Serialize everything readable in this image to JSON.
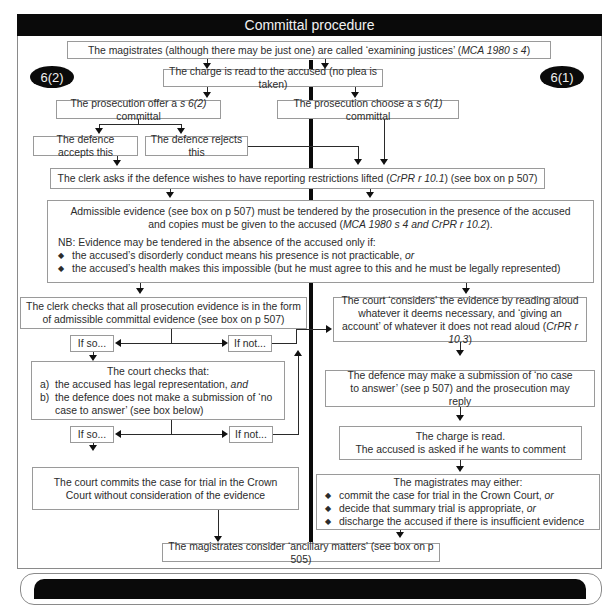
{
  "title": "Committal procedure",
  "badges": {
    "left": "6(2)",
    "right": "6(1)"
  },
  "nodes": {
    "examining_justices": {
      "text": "The magistrates (although there may be just one) are called ‘examining justices’ (",
      "ref": "MCA 1980 s 4",
      "tail": ")"
    },
    "charge_read": "The charge is read to the accused (no plea is taken)",
    "prosecution_offer": {
      "pre": "The prosecution offer a ",
      "ref": "s 6(2)",
      "post": " committal"
    },
    "prosecution_choose": {
      "pre": "The prosecution choose a ",
      "ref": "s 6(1)",
      "post": " committal"
    },
    "defence_accepts": "The defence accepts this",
    "defence_rejects": "The defence rejects this",
    "clerk_asks": {
      "pre": "The clerk asks if the defence wishes to have reporting restrictions lifted (",
      "ref": "CrPR r 10.1",
      "post": ") (see box on p 507)"
    },
    "admissible_evidence": {
      "line1": "Admissible evidence (see box on p 507) must be tendered by the prosecution in the presence of the accused",
      "line2_pre": "and copies must be given to the accused (",
      "line2_ref": "MCA 1980 s 4 and CrPR r 10.2",
      "line2_post": ").",
      "nb": "NB: Evidence may be tendered in the absence of the accused only if:",
      "bullets": [
        {
          "text": "the accused’s disorderly conduct means his presence is not practicable, ",
          "em": "or"
        },
        {
          "text": "the accused’s health makes this impossible (but he must agree to this and he must be legally represented)",
          "em": ""
        }
      ],
      "bullet_glyph": "◆"
    },
    "clerk_checks": "The clerk checks that all prosecution evidence is in the form of admissible committal evidence (see box on p 507)",
    "if_so_1": "If so...",
    "if_not_1": "If not...",
    "court_checks": {
      "heading": "The court checks that:",
      "items": [
        {
          "key": "a)",
          "text": "the accused has legal representation, ",
          "em": "and"
        },
        {
          "key": "b)",
          "text": "the defence does not make a submission of ‘no case to answer’ (see box below)",
          "em": ""
        }
      ]
    },
    "if_so_2": "If so...",
    "if_not_2": "If not...",
    "court_commits": "The court commits the case for trial in the Crown Court without consideration of the evidence",
    "court_considers": {
      "pre": "The court ‘considers’ the evidence by reading aloud whatever it deems necessary, and ‘giving an account’ of whatever it does not read aloud (",
      "ref": "CrPR r 10.3",
      "post": ")"
    },
    "no_case_submission": "The defence may make a submission of ‘no case to answer’ (see p 507) and the prosecution may reply",
    "charge_read_again": {
      "line1": "The charge is read.",
      "line2": "The accused is asked if he wants to comment"
    },
    "magistrates_either": {
      "heading": "The magistrates may either:",
      "bullets": [
        {
          "text": "commit the case for trial in the Crown Court, ",
          "em": "or"
        },
        {
          "text": "decide that summary trial is appropriate, ",
          "em": "or"
        },
        {
          "text": "discharge the accused if there is insufficient evidence",
          "em": ""
        }
      ]
    },
    "ancillary": "The magistrates consider ‘ancillary matters’ (see box on p 505)"
  },
  "colors": {
    "header_bg": "#0a0a0a",
    "header_text": "#f2f2f2",
    "box_border": "#9a9a9a",
    "text": "#2c2c2c"
  }
}
